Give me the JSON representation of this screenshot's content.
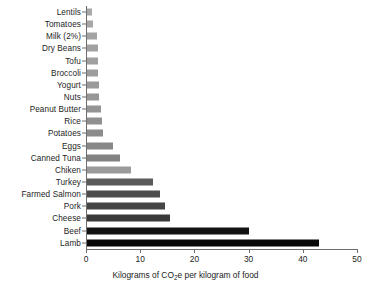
{
  "chart_data": {
    "type": "bar",
    "orientation": "horizontal",
    "title": "",
    "subtitle": "",
    "xlabel": "Kilograms of CO2e per kilogram of food",
    "xlabel_parts": {
      "before": "Kilograms of CO",
      "sub": "2",
      "after": "e per kilogram of food"
    },
    "ylabel": "",
    "xlim": [
      0,
      50
    ],
    "xticks": [
      0,
      10,
      20,
      30,
      40,
      50
    ],
    "xtick_labels": [
      "0",
      "10",
      "20",
      "30",
      "40",
      "50"
    ],
    "grid": false,
    "legend": false,
    "categories": [
      "Lentils",
      "Tomatoes",
      "Milk (2%)",
      "Dry Beans",
      "Tofu",
      "Broccoli",
      "Yogurt",
      "Nuts",
      "Peanut Butter",
      "Rice",
      "Potatoes",
      "Eggs",
      "Canned Tuna",
      "Chiken",
      "Turkey",
      "Farmed Salmon",
      "Pork",
      "Cheese",
      "Beef",
      "Lamb"
    ],
    "values": [
      0.9,
      1.1,
      1.9,
      2.0,
      2.0,
      2.0,
      2.2,
      2.3,
      2.5,
      2.7,
      2.9,
      4.8,
      6.1,
      8.1,
      12.2,
      13.5,
      14.4,
      15.4,
      29.8,
      42.8
    ],
    "bar_colors": [
      "#a8a8a8",
      "#a6a6a6",
      "#a4a4a4",
      "#a2a2a2",
      "#a0a0a0",
      "#9d9d9d",
      "#9a9a9a",
      "#979797",
      "#949494",
      "#909090",
      "#8c8c8c",
      "#878787",
      "#828282",
      "#9b9b9b",
      "#5a5a5a",
      "#4c4c4c",
      "#454545",
      "#3a3a3a",
      "#121212",
      "#080808"
    ],
    "axis_color": "#6e6e6e",
    "background": "#ffffff"
  }
}
